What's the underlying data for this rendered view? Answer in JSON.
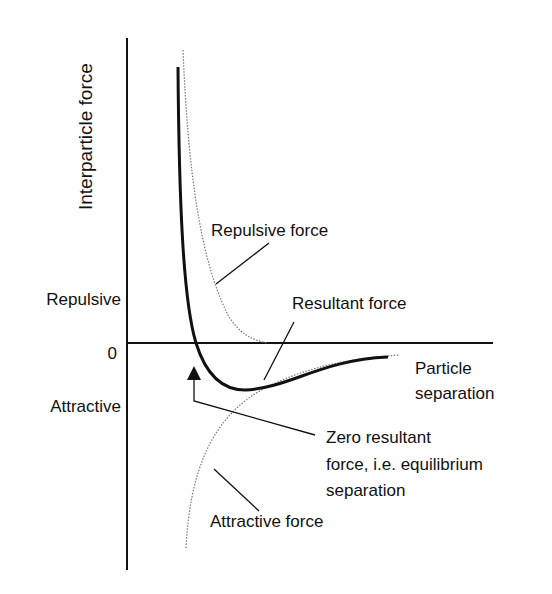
{
  "diagram": {
    "y_axis_label": "Interparticle force",
    "x_axis_label_line1": "Particle",
    "x_axis_label_line2": "separation",
    "region_repulsive": "Repulsive",
    "region_zero": "0",
    "region_attractive": "Attractive",
    "label_repulsive_force": "Repulsive force",
    "label_resultant_force": "Resultant force",
    "label_attractive_force": "Attractive force",
    "label_equilibrium_line1": "Zero resultant",
    "label_equilibrium_line2": "force, i.e. equilibrium",
    "label_equilibrium_line3": "separation"
  },
  "colors": {
    "line": "#111111",
    "dotted": "#777777",
    "background": "#ffffff"
  }
}
